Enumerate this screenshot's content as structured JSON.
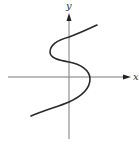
{
  "figure": {
    "axes": {
      "x_label": "x",
      "y_label": "y",
      "axis_color": "#7a7a7a",
      "arrow_color": "#222222"
    },
    "curve": {
      "color": "#2a2a2a",
      "shape": "s-curve",
      "points": [
        [
          31,
          116
        ],
        [
          69,
          102
        ],
        [
          90,
          79
        ],
        [
          69,
          62
        ],
        [
          50,
          52
        ],
        [
          69,
          37
        ],
        [
          97,
          25
        ]
      ]
    }
  }
}
